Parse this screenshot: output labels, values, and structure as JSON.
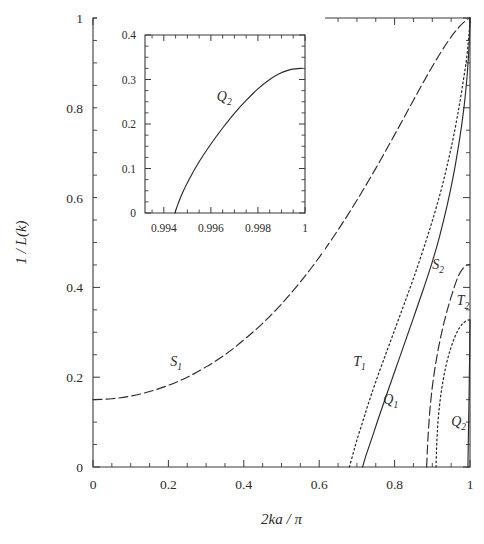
{
  "chart_data": {
    "type": "line",
    "title": "",
    "xlabel": "2ka / π",
    "ylabel": "1 / L(k)",
    "xlim": [
      0,
      1
    ],
    "ylim": [
      0,
      1
    ],
    "grid": false,
    "legend_position": "inline-annotations",
    "x_ticks": [
      "0",
      "0.2",
      "0.4",
      "0.6",
      "0.8",
      "1"
    ],
    "x_tick_values": [
      0,
      0.2,
      0.4,
      0.6,
      0.8,
      1
    ],
    "y_ticks": [
      "0",
      "0.2",
      "0.4",
      "0.6",
      "0.8",
      "1"
    ],
    "y_tick_values": [
      0,
      0.2,
      0.4,
      0.6,
      0.8,
      1
    ],
    "minor_tick_step": 0.05,
    "series": [
      {
        "name": "S1",
        "label": "S",
        "sub": "1",
        "style": "dashed",
        "points": [
          [
            0.0,
            0.15
          ],
          [
            0.05,
            0.152
          ],
          [
            0.1,
            0.158
          ],
          [
            0.15,
            0.168
          ],
          [
            0.2,
            0.182
          ],
          [
            0.25,
            0.2
          ],
          [
            0.3,
            0.223
          ],
          [
            0.35,
            0.25
          ],
          [
            0.4,
            0.283
          ],
          [
            0.45,
            0.32
          ],
          [
            0.5,
            0.363
          ],
          [
            0.55,
            0.412
          ],
          [
            0.6,
            0.467
          ],
          [
            0.65,
            0.528
          ],
          [
            0.7,
            0.594
          ],
          [
            0.75,
            0.665
          ],
          [
            0.8,
            0.74
          ],
          [
            0.85,
            0.817
          ],
          [
            0.9,
            0.892
          ],
          [
            0.94,
            0.946
          ],
          [
            0.97,
            0.979
          ],
          [
            0.99,
            0.995
          ],
          [
            1.0,
            1.0
          ]
        ]
      },
      {
        "name": "T1",
        "label": "T",
        "sub": "1",
        "style": "dotted",
        "points": [
          [
            0.68,
            0.0
          ],
          [
            0.69,
            0.03
          ],
          [
            0.7,
            0.06
          ],
          [
            0.715,
            0.1
          ],
          [
            0.73,
            0.14
          ],
          [
            0.75,
            0.19
          ],
          [
            0.775,
            0.248
          ],
          [
            0.8,
            0.305
          ],
          [
            0.825,
            0.362
          ],
          [
            0.85,
            0.42
          ],
          [
            0.875,
            0.482
          ],
          [
            0.9,
            0.548
          ],
          [
            0.925,
            0.622
          ],
          [
            0.945,
            0.692
          ],
          [
            0.96,
            0.752
          ],
          [
            0.972,
            0.807
          ],
          [
            0.982,
            0.859
          ],
          [
            0.99,
            0.903
          ],
          [
            0.995,
            0.942
          ],
          [
            0.998,
            0.97
          ],
          [
            1.0,
            1.0
          ]
        ]
      },
      {
        "name": "Q1",
        "label": "Q",
        "sub": "1",
        "style": "solid",
        "points": [
          [
            0.715,
            0.0
          ],
          [
            0.725,
            0.028
          ],
          [
            0.74,
            0.065
          ],
          [
            0.755,
            0.103
          ],
          [
            0.775,
            0.152
          ],
          [
            0.8,
            0.212
          ],
          [
            0.825,
            0.272
          ],
          [
            0.85,
            0.332
          ],
          [
            0.875,
            0.393
          ],
          [
            0.9,
            0.457
          ],
          [
            0.92,
            0.516
          ],
          [
            0.94,
            0.585
          ],
          [
            0.955,
            0.645
          ],
          [
            0.968,
            0.707
          ],
          [
            0.978,
            0.762
          ],
          [
            0.986,
            0.815
          ],
          [
            0.992,
            0.868
          ],
          [
            0.996,
            0.915
          ],
          [
            0.999,
            0.965
          ],
          [
            1.0,
            1.0
          ]
        ]
      },
      {
        "name": "S2",
        "label": "S",
        "sub": "2",
        "style": "dashed",
        "points": [
          [
            0.885,
            0.0
          ],
          [
            0.887,
            0.04
          ],
          [
            0.89,
            0.085
          ],
          [
            0.894,
            0.13
          ],
          [
            0.9,
            0.178
          ],
          [
            0.908,
            0.225
          ],
          [
            0.918,
            0.272
          ],
          [
            0.93,
            0.318
          ],
          [
            0.944,
            0.362
          ],
          [
            0.958,
            0.4
          ],
          [
            0.97,
            0.427
          ],
          [
            0.982,
            0.443
          ],
          [
            0.992,
            0.45
          ],
          [
            1.0,
            0.45
          ]
        ]
      },
      {
        "name": "T2",
        "label": "T",
        "sub": "2",
        "style": "dotted",
        "points": [
          [
            0.91,
            0.0
          ],
          [
            0.911,
            0.035
          ],
          [
            0.913,
            0.072
          ],
          [
            0.916,
            0.11
          ],
          [
            0.921,
            0.15
          ],
          [
            0.928,
            0.19
          ],
          [
            0.937,
            0.228
          ],
          [
            0.948,
            0.262
          ],
          [
            0.96,
            0.29
          ],
          [
            0.972,
            0.31
          ],
          [
            0.984,
            0.322
          ],
          [
            0.994,
            0.327
          ],
          [
            1.0,
            0.328
          ]
        ]
      },
      {
        "name": "Q2",
        "label": "Q",
        "sub": "2",
        "style": "solid",
        "points": [
          [
            0.9945,
            0.0
          ],
          [
            0.995,
            0.03
          ],
          [
            0.9955,
            0.058
          ],
          [
            0.9962,
            0.092
          ],
          [
            0.997,
            0.132
          ],
          [
            0.9978,
            0.175
          ],
          [
            0.9985,
            0.215
          ],
          [
            0.999,
            0.25
          ],
          [
            0.9994,
            0.283
          ],
          [
            0.9997,
            0.308
          ],
          [
            0.9999,
            0.322
          ],
          [
            1.0,
            0.328
          ]
        ]
      }
    ],
    "annotations": [
      {
        "text": "S",
        "sub": "1",
        "x": 0.205,
        "y": 0.225
      },
      {
        "text": "T",
        "sub": "1",
        "x": 0.69,
        "y": 0.225
      },
      {
        "text": "Q",
        "sub": "1",
        "x": 0.77,
        "y": 0.14
      },
      {
        "text": "S",
        "sub": "2",
        "x": 0.9,
        "y": 0.44
      },
      {
        "text": "T",
        "sub": "2",
        "x": 0.965,
        "y": 0.36
      },
      {
        "text": "Q",
        "sub": "2",
        "x": 0.95,
        "y": 0.092
      }
    ],
    "inset": {
      "type": "line",
      "xlim": [
        0.9932,
        1.0
      ],
      "ylim": [
        0,
        0.4
      ],
      "xlabel": "",
      "ylabel": "",
      "x_ticks": [
        "0.994",
        "0.996",
        "0.998",
        "1"
      ],
      "x_tick_values": [
        0.994,
        0.996,
        0.998,
        1
      ],
      "y_ticks": [
        "0",
        "0.1",
        "0.2",
        "0.3",
        "0.4"
      ],
      "y_tick_values": [
        0,
        0.1,
        0.2,
        0.3,
        0.4
      ],
      "minor_tick_x_step": 0.0005,
      "minor_tick_y_step": 0.025,
      "series": [
        {
          "name": "Q2",
          "label": "Q",
          "sub": "2",
          "style": "solid",
          "points": [
            [
              0.99447,
              0.0
            ],
            [
              0.9946,
              0.02
            ],
            [
              0.9948,
              0.046
            ],
            [
              0.9951,
              0.078
            ],
            [
              0.9955,
              0.115
            ],
            [
              0.996,
              0.155
            ],
            [
              0.9965,
              0.191
            ],
            [
              0.997,
              0.224
            ],
            [
              0.9975,
              0.253
            ],
            [
              0.998,
              0.279
            ],
            [
              0.9985,
              0.3
            ],
            [
              0.9989,
              0.313
            ],
            [
              0.9993,
              0.321
            ],
            [
              0.9996,
              0.324
            ],
            [
              0.99985,
              0.325
            ]
          ]
        }
      ],
      "annotations": [
        {
          "text": "Q",
          "sub": "2",
          "x": 0.99625,
          "y": 0.252
        }
      ]
    }
  }
}
